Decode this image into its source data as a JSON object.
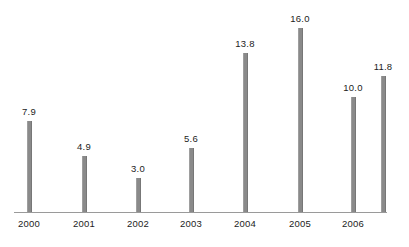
{
  "chart_data": {
    "type": "bar",
    "title": "",
    "subtitle": "",
    "xlabel": "",
    "ylabel": "",
    "categories": [
      "2000",
      "2001",
      "2002",
      "2003",
      "2004",
      "2005",
      "2006",
      ""
    ],
    "values": [
      7.9,
      4.9,
      3.0,
      5.6,
      13.8,
      16.0,
      10.0,
      11.8
    ],
    "point_labels": [
      "7.9",
      "4.9",
      "3.0",
      "5.6",
      "13.8",
      "16.0",
      "10.0",
      "11.8"
    ],
    "tick_labels": [
      "2000",
      "2001",
      "2002",
      "2003",
      "2004",
      "2005",
      "2006"
    ],
    "ylim": [
      0,
      16.0
    ],
    "grid": false,
    "legend": false,
    "legend_position": "none",
    "bar_color": "#8a8a8a",
    "axis_color": "#9a9a9a",
    "label_color": "#1c1c1c",
    "background": "#ffffff"
  },
  "chart": {
    "bars": [
      {
        "label": "7.9",
        "value": 7.9,
        "x": 29,
        "tick": "2000"
      },
      {
        "label": "4.9",
        "value": 4.9,
        "x": 84,
        "tick": "2001"
      },
      {
        "label": "3.0",
        "value": 3.0,
        "x": 138,
        "tick": "2002"
      },
      {
        "label": "5.6",
        "value": 5.6,
        "x": 191,
        "tick": "2003"
      },
      {
        "label": "13.8",
        "value": 13.8,
        "x": 245,
        "tick": "2004"
      },
      {
        "label": "16.0",
        "value": 16.0,
        "x": 300,
        "tick": "2005"
      },
      {
        "label": "10.0",
        "value": 10.0,
        "x": 353,
        "tick": "2006"
      },
      {
        "label": "11.8",
        "value": 11.8,
        "x": 383,
        "tick": ""
      }
    ],
    "baseline_y": 212,
    "axis_start_x": 14,
    "axis_end_x": 387,
    "px_per_unit": 11.5
  }
}
